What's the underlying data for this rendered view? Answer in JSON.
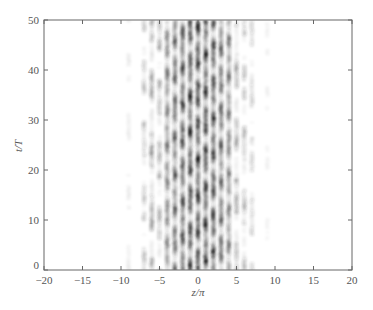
{
  "chart_data": {
    "type": "heatmap",
    "title": "",
    "xlabel": "z/π",
    "ylabel": "t/T",
    "xlim": [
      -20,
      20
    ],
    "ylim": [
      0,
      50
    ],
    "xticks": [
      -20,
      -15,
      -10,
      -5,
      0,
      5,
      10,
      15,
      20
    ],
    "yticks": [
      0,
      10,
      20,
      30,
      40,
      50
    ],
    "grid": false,
    "colormap": "grayscale (white=0, black=max)",
    "stripes": [
      {
        "z": -9,
        "intensity": 0.08
      },
      {
        "z": -7,
        "intensity": 0.25
      },
      {
        "z": -6,
        "intensity": 0.45
      },
      {
        "z": -5,
        "intensity": 0.35
      },
      {
        "z": -4,
        "intensity": 0.6
      },
      {
        "z": -3,
        "intensity": 0.75
      },
      {
        "z": -2,
        "intensity": 0.9
      },
      {
        "z": -1,
        "intensity": 0.95
      },
      {
        "z": 0,
        "intensity": 1.0
      },
      {
        "z": 1,
        "intensity": 0.95
      },
      {
        "z": 2,
        "intensity": 0.9
      },
      {
        "z": 3,
        "intensity": 0.75
      },
      {
        "z": 4,
        "intensity": 0.6
      },
      {
        "z": 5,
        "intensity": 0.4
      },
      {
        "z": 6,
        "intensity": 0.3
      },
      {
        "z": 7,
        "intensity": 0.2
      },
      {
        "z": 9,
        "intensity": 0.06
      }
    ],
    "plot_area_px": {
      "left": 44,
      "right": 352,
      "top": 20,
      "bottom": 270
    },
    "axis_color": "#666666"
  }
}
